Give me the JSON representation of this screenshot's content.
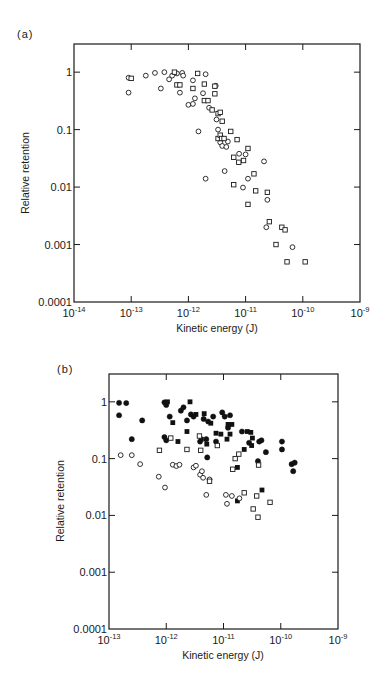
{
  "chart_data": [
    {
      "panel": "(a)",
      "type": "scatter",
      "xlabel": "Kinetic energy (J)",
      "ylabel": "Relative retention",
      "xscale": "log",
      "yscale": "log",
      "xlim": [
        1e-14,
        1e-09
      ],
      "ylim": [
        0.0001,
        3
      ],
      "xticks": [
        "10^-14",
        "10^-13",
        "10^-12",
        "10^-11",
        "10^-10",
        "10^-9"
      ],
      "yticks": [
        "1",
        "0.1",
        "0.01",
        "0.001",
        "0.0001"
      ],
      "grid": false,
      "frame": {
        "left": 74,
        "right": 360,
        "top": 44,
        "bottom": 302,
        "xlog_min": -14,
        "xlog_max": -9,
        "ylog_top": 0.49,
        "ylog_bottom": -4
      },
      "series": [
        {
          "name": "open circles",
          "marker": "open-circle",
          "points": [
            [
              9e-14,
              0.8
            ],
            [
              9e-14,
              0.44
            ],
            [
              1.8e-13,
              0.87
            ],
            [
              2.6e-13,
              0.97
            ],
            [
              3.3e-13,
              0.52
            ],
            [
              3.8e-13,
              1.0
            ],
            [
              4.6e-13,
              0.75
            ],
            [
              5.2e-13,
              0.87
            ],
            [
              6.3e-13,
              0.95
            ],
            [
              7.1e-13,
              0.44
            ],
            [
              7.8e-13,
              0.97
            ],
            [
              8.1e-13,
              0.87
            ],
            [
              1e-12,
              0.27
            ],
            [
              1.2e-12,
              0.72
            ],
            [
              1.2e-12,
              0.28
            ],
            [
              1.3e-12,
              0.35
            ],
            [
              1.5e-12,
              0.093
            ],
            [
              1.8e-12,
              0.43
            ],
            [
              2e-12,
              0.92
            ],
            [
              2e-12,
              0.014
            ],
            [
              2.3e-12,
              0.24
            ],
            [
              3e-12,
              0.58
            ],
            [
              3.1e-12,
              0.15
            ],
            [
              3.3e-12,
              0.1
            ],
            [
              3.6e-12,
              0.06
            ],
            [
              3.9e-12,
              0.052
            ],
            [
              4.3e-12,
              0.019
            ],
            [
              4.6e-12,
              0.05
            ],
            [
              4.9e-12,
              0.062
            ],
            [
              7.7e-12,
              0.038
            ],
            [
              9e-12,
              0.0098
            ],
            [
              1e-11,
              0.037
            ],
            [
              1.1e-11,
              0.014
            ],
            [
              2.1e-11,
              0.028
            ],
            [
              2.4e-11,
              0.006
            ],
            [
              2.3e-11,
              0.002
            ],
            [
              6.6e-11,
              0.0009
            ]
          ]
        },
        {
          "name": "open squares",
          "marker": "open-square",
          "points": [
            [
              1e-13,
              0.78
            ],
            [
              5.7e-13,
              1.0
            ],
            [
              6.3e-13,
              0.6
            ],
            [
              7.1e-13,
              0.6
            ],
            [
              1.2e-12,
              0.52
            ],
            [
              1.45e-12,
              0.95
            ],
            [
              1.9e-12,
              0.62
            ],
            [
              1.9e-12,
              0.32
            ],
            [
              2.2e-12,
              0.32
            ],
            [
              2.6e-12,
              0.22
            ],
            [
              2.9e-12,
              0.57
            ],
            [
              2.9e-12,
              0.42
            ],
            [
              3.3e-12,
              0.19
            ],
            [
              3.6e-12,
              0.2
            ],
            [
              3.9e-12,
              0.14
            ],
            [
              3.3e-12,
              0.07
            ],
            [
              3.6e-12,
              0.08
            ],
            [
              3.8e-12,
              0.07
            ],
            [
              4.2e-12,
              0.07
            ],
            [
              5.5e-12,
              0.093
            ],
            [
              6.2e-12,
              0.033
            ],
            [
              6.2e-12,
              0.011
            ],
            [
              7.1e-12,
              0.067
            ],
            [
              7.6e-12,
              0.027
            ],
            [
              9.2e-12,
              0.029
            ],
            [
              1.1e-11,
              0.047
            ],
            [
              1.1e-11,
              0.005
            ],
            [
              1.4e-11,
              0.017
            ],
            [
              1.5e-11,
              0.0086
            ],
            [
              2.4e-11,
              0.0081
            ],
            [
              2.6e-11,
              0.0025
            ],
            [
              3.4e-11,
              0.001
            ],
            [
              4.3e-11,
              0.002
            ],
            [
              4.9e-11,
              0.0018
            ],
            [
              5.3e-11,
              0.0005
            ],
            [
              1.1e-10,
              0.0005
            ]
          ]
        }
      ]
    },
    {
      "panel": "(b)",
      "type": "scatter",
      "xlabel": "Kinetic energy (J)",
      "ylabel": "Relative retention",
      "xscale": "log",
      "yscale": "log",
      "xlim": [
        1e-13,
        1e-09
      ],
      "ylim": [
        0.0001,
        3
      ],
      "xticks": [
        "10^-13",
        "10^-12",
        "10^-11",
        "10^-10",
        "10^-9"
      ],
      "yticks": [
        "1",
        "0.1",
        "0.01",
        "0.001",
        "0.0001"
      ],
      "grid": false,
      "frame": {
        "left": 109,
        "right": 338,
        "top": 374,
        "bottom": 629,
        "xlog_min": -13,
        "xlog_max": -9,
        "ylog_top": 0.49,
        "ylog_bottom": -4
      },
      "series": [
        {
          "name": "filled circles",
          "marker": "filled-circle",
          "points": [
            [
              1.5e-13,
              0.96
            ],
            [
              2e-13,
              0.95
            ],
            [
              1.5e-13,
              0.58
            ],
            [
              2.5e-13,
              0.22
            ],
            [
              3.8e-13,
              0.47
            ],
            [
              9.3e-13,
              0.98
            ],
            [
              1e-12,
              0.88
            ],
            [
              9.3e-13,
              0.24
            ],
            [
              1e-12,
              0.21
            ],
            [
              1.15e-12,
              0.55
            ],
            [
              1.8e-12,
              0.7
            ],
            [
              2e-12,
              0.8
            ],
            [
              2.3e-12,
              0.47
            ],
            [
              2.7e-12,
              0.6
            ],
            [
              3e-12,
              0.55
            ],
            [
              3.9e-12,
              0.2
            ],
            [
              4.5e-12,
              0.5
            ],
            [
              5e-12,
              0.22
            ],
            [
              5.2e-12,
              0.105
            ],
            [
              5.4e-12,
              0.45
            ],
            [
              6.6e-12,
              0.55
            ],
            [
              7.4e-12,
              0.2
            ],
            [
              9.5e-12,
              0.65
            ],
            [
              1.05e-11,
              0.55
            ],
            [
              1.2e-11,
              0.35
            ],
            [
              1.3e-11,
              0.58
            ],
            [
              2.1e-11,
              0.3
            ],
            [
              2.8e-11,
              0.19
            ],
            [
              4e-11,
              0.09
            ],
            [
              4.2e-11,
              0.2
            ],
            [
              4.6e-11,
              0.21
            ],
            [
              5.5e-11,
              0.13
            ],
            [
              1.05e-10,
              0.2
            ],
            [
              1.05e-10,
              0.145
            ],
            [
              1.55e-10,
              0.08
            ],
            [
              1.65e-10,
              0.06
            ],
            [
              1.75e-10,
              0.085
            ]
          ]
        },
        {
          "name": "filled squares",
          "marker": "filled-square",
          "points": [
            [
              1.05e-12,
              1.0
            ],
            [
              1.3e-12,
              0.43
            ],
            [
              1.6e-12,
              0.2
            ],
            [
              2.3e-12,
              0.3
            ],
            [
              2.6e-12,
              1.0
            ],
            [
              3.3e-12,
              0.6
            ],
            [
              4.1e-12,
              0.22
            ],
            [
              4.6e-12,
              0.62
            ],
            [
              5.1e-12,
              0.18
            ],
            [
              6e-12,
              0.42
            ],
            [
              7.4e-12,
              0.28
            ],
            [
              9e-12,
              0.27
            ],
            [
              1.15e-11,
              0.22
            ],
            [
              1.2e-11,
              0.4
            ],
            [
              1.4e-11,
              0.4
            ],
            [
              1.3e-11,
              0.27
            ],
            [
              1.75e-11,
              0.07
            ],
            [
              1.75e-11,
              0.018
            ],
            [
              2.3e-11,
              0.145
            ],
            [
              2.6e-11,
              0.3
            ],
            [
              3e-11,
              0.29
            ],
            [
              3.1e-11,
              0.17
            ],
            [
              3.2e-11,
              0.23
            ],
            [
              4.7e-11,
              0.028
            ]
          ]
        },
        {
          "name": "open circles",
          "marker": "open-circle",
          "points": [
            [
              1.6e-13,
              0.115
            ],
            [
              2.5e-13,
              0.115
            ],
            [
              3.5e-13,
              0.08
            ],
            [
              7.4e-13,
              0.048
            ],
            [
              9.5e-13,
              0.031
            ],
            [
              1.3e-12,
              0.078
            ],
            [
              1.5e-12,
              0.074
            ],
            [
              1.7e-12,
              0.078
            ],
            [
              3e-12,
              0.07
            ],
            [
              3.3e-12,
              0.075
            ],
            [
              3.9e-12,
              0.052
            ],
            [
              4.2e-12,
              0.06
            ],
            [
              4.4e-12,
              0.046
            ],
            [
              5e-12,
              0.023
            ],
            [
              5.7e-12,
              0.043
            ],
            [
              1.1e-11,
              0.023
            ],
            [
              1.15e-11,
              0.016
            ],
            [
              1.4e-11,
              0.022
            ],
            [
              1.9e-11,
              0.02
            ]
          ]
        },
        {
          "name": "open squares",
          "marker": "open-square",
          "points": [
            [
              7.6e-13,
              0.14
            ],
            [
              1.2e-12,
              0.23
            ],
            [
              2.3e-12,
              0.145
            ],
            [
              3.8e-12,
              0.25
            ],
            [
              4e-12,
              0.14
            ],
            [
              5.7e-12,
              0.04
            ],
            [
              7.8e-12,
              0.17
            ],
            [
              1.45e-11,
              0.065
            ],
            [
              1.6e-11,
              0.1
            ],
            [
              1.85e-11,
              0.12
            ],
            [
              2.3e-11,
              0.025
            ],
            [
              3.3e-11,
              0.013
            ],
            [
              3.8e-11,
              0.022
            ],
            [
              4e-11,
              0.0093
            ],
            [
              4.1e-11,
              0.077
            ],
            [
              6.5e-11,
              0.017
            ]
          ]
        }
      ]
    }
  ],
  "panels": {
    "a": {
      "label": "(a)",
      "xlabel": "Kinetic energy (J)",
      "ylabel": "Relative retention",
      "x_tick_base": [
        "10",
        "10",
        "10",
        "10",
        "10",
        "10"
      ],
      "x_tick_exp": [
        "-14",
        "-13",
        "-12",
        "-11",
        "-10",
        "-9"
      ],
      "y_ticks": [
        "1",
        "0.1",
        "0.01",
        "0.001",
        "0.0001"
      ]
    },
    "b": {
      "label": "(b)",
      "xlabel": "Kinetic energy (J)",
      "ylabel": "Relative retention",
      "x_tick_base": [
        "10",
        "10",
        "10",
        "10",
        "10"
      ],
      "x_tick_exp": [
        "-13",
        "-12",
        "-11",
        "-10",
        "-9"
      ],
      "y_ticks": [
        "1",
        "0.1",
        "0.01",
        "0.001",
        "0.0001"
      ]
    }
  }
}
